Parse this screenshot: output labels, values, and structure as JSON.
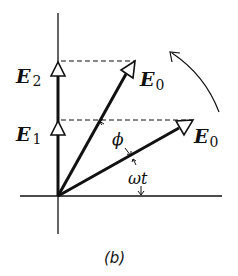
{
  "figure": {
    "caption": "(b)",
    "colors": {
      "stroke": "#111111",
      "background": "#ffffff"
    }
  },
  "labels": {
    "e2": {
      "main": "E",
      "sub": "2"
    },
    "e1": {
      "main": "E",
      "sub": "1"
    },
    "e0_upper": {
      "main": "E",
      "sub": "0"
    },
    "e0_lower": {
      "main": "E",
      "sub": "0"
    },
    "phi": "ϕ",
    "omega_t": "ωt"
  },
  "geometry": {
    "origin": [
      58,
      196
    ],
    "vertical_axis": {
      "x": 58,
      "y_top": 13,
      "y_bottom": 234
    },
    "horizontal_axis": {
      "y": 196,
      "x_left": 20,
      "x_right": 222
    },
    "e0_upper_tip": [
      135,
      61
    ],
    "e0_lower_tip": [
      193,
      120
    ],
    "e2_tip_y": 61,
    "e1_tip_y": 120,
    "rotation_direction": "counterclockwise"
  }
}
